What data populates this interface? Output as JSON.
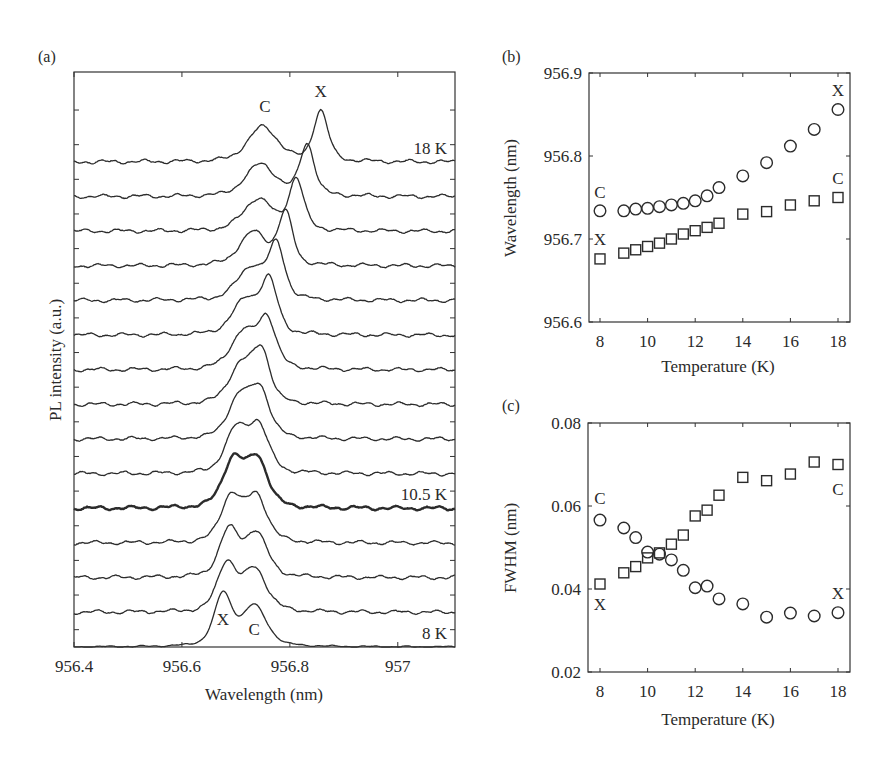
{
  "figure": {
    "panel_labels": [
      "(a)",
      "(b)",
      "(c)"
    ]
  },
  "chart_data": [
    {
      "id": "a",
      "type": "line",
      "title": "",
      "panel_label": "(a)",
      "xlabel": "Wavelength (nm)",
      "ylabel": "PL intensity (a.u.)",
      "xlim": [
        956.4,
        957.106
      ],
      "xticks": [
        956.4,
        956.6,
        956.8,
        957
      ],
      "xtick_labels": [
        "956.4",
        "956.6",
        "956.8",
        "957"
      ],
      "grid": false,
      "stacked_offset_traces": true,
      "highlighted_trace_temperature_K": 10.5,
      "trace_labels": [
        {
          "text": "18 K",
          "temperature": 18
        },
        {
          "text": "10.5 K",
          "temperature": 10.5
        },
        {
          "text": "8 K",
          "temperature": 8
        }
      ],
      "peak_labels": [
        {
          "text": "C",
          "trace": 18,
          "wavelength": 956.754
        },
        {
          "text": "X",
          "trace": 18,
          "wavelength": 956.857
        },
        {
          "text": "X",
          "trace": 8,
          "wavelength": 956.676
        },
        {
          "text": "C",
          "trace": 8,
          "wavelength": 956.734
        }
      ],
      "series": [
        {
          "temperature": 8,
          "X_peak": 956.676,
          "C_peak": 956.734,
          "X_height": 56,
          "C_height": 44,
          "X_fwhm": 0.041,
          "C_fwhm": 0.057
        },
        {
          "temperature": 9,
          "X_peak": 956.683,
          "C_peak": 956.735,
          "X_height": 52,
          "C_height": 46,
          "X_fwhm": 0.044,
          "C_fwhm": 0.055
        },
        {
          "temperature": 9.5,
          "X_peak": 956.687,
          "C_peak": 956.737,
          "X_height": 50,
          "C_height": 48,
          "X_fwhm": 0.045,
          "C_fwhm": 0.052
        },
        {
          "temperature": 10,
          "X_peak": 956.691,
          "C_peak": 956.738,
          "X_height": 50,
          "C_height": 50,
          "X_fwhm": 0.047,
          "C_fwhm": 0.049
        },
        {
          "temperature": 10.5,
          "X_peak": 956.695,
          "C_peak": 956.74,
          "X_height": 52,
          "C_height": 52,
          "X_fwhm": 0.049,
          "C_fwhm": 0.048
        },
        {
          "temperature": 11,
          "X_peak": 956.7,
          "C_peak": 956.742,
          "X_height": 46,
          "C_height": 50,
          "X_fwhm": 0.051,
          "C_fwhm": 0.047
        },
        {
          "temperature": 11.5,
          "X_peak": 956.706,
          "C_peak": 956.745,
          "X_height": 44,
          "C_height": 50,
          "X_fwhm": 0.053,
          "C_fwhm": 0.045
        },
        {
          "temperature": 12,
          "X_peak": 956.71,
          "C_peak": 956.748,
          "X_height": 42,
          "C_height": 52,
          "X_fwhm": 0.058,
          "C_fwhm": 0.04
        },
        {
          "temperature": 12.5,
          "X_peak": 956.714,
          "C_peak": 956.758,
          "X_height": 40,
          "C_height": 52,
          "X_fwhm": 0.059,
          "C_fwhm": 0.041
        },
        {
          "temperature": 13,
          "X_peak": 956.719,
          "C_peak": 956.762,
          "X_height": 38,
          "C_height": 54,
          "X_fwhm": 0.063,
          "C_fwhm": 0.038
        },
        {
          "temperature": 14,
          "X_peak": 956.73,
          "C_peak": 956.776,
          "X_height": 36,
          "C_height": 55,
          "X_fwhm": 0.067,
          "C_fwhm": 0.036
        },
        {
          "temperature": 15,
          "X_peak": 956.733,
          "C_peak": 956.792,
          "X_height": 36,
          "C_height": 55,
          "X_fwhm": 0.066,
          "C_fwhm": 0.033
        },
        {
          "temperature": 16,
          "X_peak": 956.741,
          "C_peak": 956.812,
          "X_height": 35,
          "C_height": 56,
          "X_fwhm": 0.068,
          "C_fwhm": 0.034
        },
        {
          "temperature": 17,
          "X_peak": 956.746,
          "C_peak": 956.832,
          "X_height": 35,
          "C_height": 56,
          "X_fwhm": 0.071,
          "C_fwhm": 0.034
        },
        {
          "temperature": 18,
          "X_peak": 956.75,
          "C_peak": 956.857,
          "X_height": 38,
          "C_height": 55,
          "X_fwhm": 0.07,
          "C_fwhm": 0.034
        }
      ],
      "note": "Stacked PL spectra 8 K (bottom) to 18 K (top); two peaks X and C cross between 10 and 11 K. For each trace, 'X_peak'/'C_peak' are the lower- and higher-wavelength peaks as plotted in (b) (circles = upper, squares = lower)."
    },
    {
      "id": "b",
      "type": "scatter",
      "panel_label": "(b)",
      "xlabel": "Temperature (K)",
      "ylabel": "Wavelength (nm)",
      "xlim": [
        7.5,
        18.5
      ],
      "ylim": [
        956.6,
        956.9
      ],
      "xticks": [
        8,
        10,
        12,
        14,
        16,
        18
      ],
      "yticks": [
        956.6,
        956.7,
        956.8,
        956.9
      ],
      "ytick_labels": [
        "956.6",
        "956.7",
        "956.8",
        "956.9"
      ],
      "grid": false,
      "x": [
        8,
        9,
        9.5,
        10,
        10.5,
        11,
        11.5,
        12,
        12.5,
        13,
        14,
        15,
        16,
        17,
        18
      ],
      "series": [
        {
          "name": "circles",
          "marker": "circle",
          "values": [
            956.734,
            956.734,
            956.736,
            956.737,
            956.739,
            956.741,
            956.743,
            956.746,
            956.752,
            956.762,
            956.776,
            956.792,
            956.812,
            956.832,
            956.856
          ]
        },
        {
          "name": "squares",
          "marker": "square",
          "values": [
            956.676,
            956.683,
            956.687,
            956.691,
            956.695,
            956.7,
            956.706,
            956.71,
            956.714,
            956.719,
            956.73,
            956.733,
            956.741,
            956.746,
            956.75
          ]
        }
      ],
      "annotations": [
        {
          "text": "C",
          "x": 8,
          "y": 956.757
        },
        {
          "text": "X",
          "x": 8,
          "y": 956.7
        },
        {
          "text": "X",
          "x": 18,
          "y": 956.88
        },
        {
          "text": "C",
          "x": 18,
          "y": 956.773
        }
      ]
    },
    {
      "id": "c",
      "type": "scatter",
      "panel_label": "(c)",
      "xlabel": "Temperature (K)",
      "ylabel": "FWHM (nm)",
      "xlim": [
        7.5,
        18.5
      ],
      "ylim": [
        0.02,
        0.08
      ],
      "xticks": [
        8,
        10,
        12,
        14,
        16,
        18
      ],
      "yticks": [
        0.02,
        0.04,
        0.06,
        0.08
      ],
      "ytick_labels": [
        "0.02",
        "0.04",
        "0.06",
        "0.08"
      ],
      "grid": false,
      "x": [
        8,
        9,
        9.5,
        10,
        10.5,
        11,
        11.5,
        12,
        12.5,
        13,
        14,
        15,
        16,
        17,
        18
      ],
      "series": [
        {
          "name": "circles",
          "marker": "circle",
          "values": [
            0.0566,
            0.0547,
            0.0524,
            0.0489,
            0.0484,
            0.047,
            0.0445,
            0.0403,
            0.0407,
            0.0376,
            0.0364,
            0.0332,
            0.0342,
            0.0335,
            0.0343
          ]
        },
        {
          "name": "squares",
          "marker": "square",
          "values": [
            0.0412,
            0.0439,
            0.0454,
            0.0475,
            0.0487,
            0.0508,
            0.053,
            0.0576,
            0.059,
            0.0626,
            0.0669,
            0.0661,
            0.0677,
            0.0706,
            0.07
          ]
        }
      ],
      "annotations": [
        {
          "text": "C",
          "x": 8,
          "y": 0.062
        },
        {
          "text": "X",
          "x": 8,
          "y": 0.0365
        },
        {
          "text": "C",
          "x": 18,
          "y": 0.064
        },
        {
          "text": "X",
          "x": 18,
          "y": 0.039
        }
      ]
    }
  ]
}
